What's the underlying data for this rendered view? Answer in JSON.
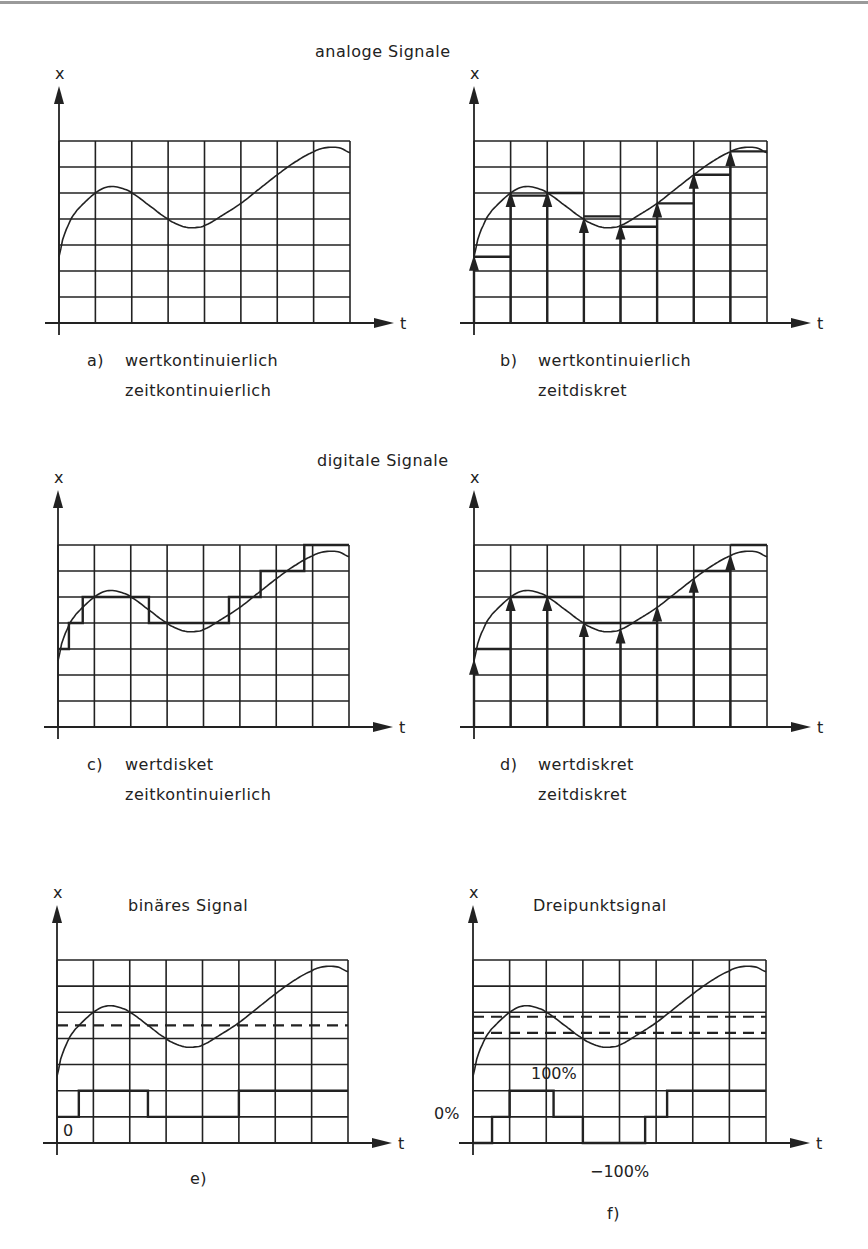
{
  "sections": [
    {
      "title": "analoge Signale",
      "x": 315,
      "y": 42
    },
    {
      "title": "digitale Signale",
      "x": 317,
      "y": 451
    }
  ],
  "axis_labels": {
    "y": "x",
    "x": "t"
  },
  "colors": {
    "ink": "#222222",
    "rule": "#9a9a9a",
    "background": "#ffffff"
  },
  "panels": [
    {
      "id": "a",
      "letter": "a)",
      "line1": "wertkontinuierlich",
      "line2": "zeitkontinuierlich",
      "grid": {
        "left": 59,
        "top": 141,
        "right": 350,
        "bottom": 323
      },
      "caption_x": 87,
      "caption_y": 348,
      "kind": "analog-continuous"
    },
    {
      "id": "b",
      "letter": "b)",
      "line1": "wertkontinuierlich",
      "line2": "zeitdiskret",
      "grid": {
        "left": 474,
        "top": 141,
        "right": 767,
        "bottom": 323
      },
      "caption_x": 500,
      "caption_y": 348,
      "kind": "analog-sampled"
    },
    {
      "id": "c",
      "letter": "c)",
      "line1": "wertdisket",
      "line2": "zeitkontinuierlich",
      "grid": {
        "left": 58,
        "top": 545,
        "right": 349,
        "bottom": 727
      },
      "caption_x": 87,
      "caption_y": 752,
      "kind": "quantized-continuous"
    },
    {
      "id": "d",
      "letter": "d)",
      "line1": "wertdiskret",
      "line2": "zeitdiskret",
      "grid": {
        "left": 474,
        "top": 545,
        "right": 767,
        "bottom": 727
      },
      "caption_x": 500,
      "caption_y": 752,
      "kind": "quantized-sampled"
    },
    {
      "id": "e",
      "letter": "e)",
      "title": "binäres Signal",
      "title_x": 128,
      "title_y": 896,
      "grid": {
        "left": 57,
        "top": 960,
        "right": 348,
        "bottom": 1143
      },
      "caption_x": 190,
      "caption_y": 1168,
      "kind": "binary",
      "level_label": "0"
    },
    {
      "id": "f",
      "letter": "f)",
      "title": "Dreipunktsignal",
      "title_x": 533,
      "title_y": 896,
      "grid": {
        "left": 473,
        "top": 960,
        "right": 766,
        "bottom": 1143
      },
      "caption_x": 607,
      "caption_y": 1202,
      "kind": "three-point",
      "labels": {
        "plus": "100%",
        "zero": "0%",
        "minus": "−100%"
      }
    }
  ],
  "chart_data": {
    "type": "line",
    "xlabel": "t",
    "ylabel": "x",
    "grid": {
      "columns": 8,
      "rows": 7,
      "on": true
    },
    "signal": {
      "t": [
        0,
        0.1,
        0.2,
        0.35,
        0.5,
        0.75,
        1.0,
        1.25,
        1.5,
        1.75,
        2.0,
        2.5,
        3.0,
        3.25,
        3.5,
        3.75,
        4.0,
        4.5,
        5.0,
        5.5,
        6.0,
        6.5,
        7.0,
        7.25,
        7.5,
        7.75,
        8.0
      ],
      "x": [
        2.55,
        3.2,
        3.6,
        4.05,
        4.35,
        4.7,
        5.0,
        5.2,
        5.25,
        5.17,
        5.0,
        4.5,
        4.0,
        3.8,
        3.68,
        3.67,
        3.75,
        4.15,
        4.6,
        5.15,
        5.7,
        6.2,
        6.58,
        6.72,
        6.76,
        6.72,
        6.55
      ]
    },
    "panels": {
      "a": {
        "name": "wertkontinuierlich, zeitkontinuierlich",
        "type": "line"
      },
      "b": {
        "name": "wertkontinuierlich, zeitdiskret",
        "type": "stem+hold",
        "sample_t": [
          0,
          1,
          2,
          3,
          4,
          5,
          6,
          7
        ],
        "sample_x": [
          2.55,
          5.0,
          5.0,
          4.0,
          3.75,
          4.6,
          5.7,
          6.58
        ],
        "hold_x": [
          2.55,
          4.9,
          5.0,
          4.1,
          3.7,
          4.6,
          5.7,
          6.6
        ]
      },
      "c": {
        "name": "wertdisket, zeitkontinuierlich",
        "type": "step",
        "step_t": [
          0,
          0.3,
          0.68,
          2.5,
          4.7,
          5.57,
          6.77,
          8.0
        ],
        "levels": [
          3,
          4,
          5,
          4,
          5,
          6,
          7
        ]
      },
      "d": {
        "name": "wertdiskret, zeitdiskret",
        "type": "stem+hold",
        "sample_t": [
          0,
          1,
          2,
          3,
          4,
          5,
          6,
          7
        ],
        "sample_x": [
          2.55,
          5.0,
          5.0,
          4.0,
          3.75,
          4.6,
          5.7,
          6.58
        ],
        "hold_x": [
          3,
          5,
          5,
          4,
          4,
          5,
          6,
          7
        ]
      },
      "e": {
        "name": "binäres Signal",
        "type": "step",
        "threshold": 4.5,
        "step_t": [
          0,
          0.6,
          2.5,
          5.0,
          8.0
        ],
        "levels": [
          1,
          2,
          1,
          2
        ],
        "level_labels": {
          "1": "0"
        }
      },
      "f": {
        "name": "Dreipunktsignal",
        "type": "step",
        "thresholds": [
          4.21,
          4.83
        ],
        "step_t": [
          0,
          0.52,
          1.0,
          2.2,
          3.0,
          4.7,
          5.3,
          8.0
        ],
        "levels": [
          0,
          1,
          2,
          1,
          0,
          1,
          2
        ],
        "level_labels": {
          "0": "−100%",
          "1": "0%",
          "2": "100%"
        }
      }
    }
  }
}
